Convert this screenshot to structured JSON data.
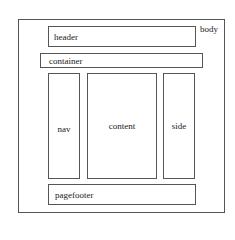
{
  "diagram": {
    "title": "",
    "nodes": {
      "body": {
        "label": "body"
      },
      "header": {
        "label": "header"
      },
      "container": {
        "label": "container"
      },
      "nav": {
        "label": "nav"
      },
      "content": {
        "label": "content"
      },
      "side": {
        "label": "side"
      },
      "pagefooter": {
        "label": "pagefooter"
      }
    }
  }
}
